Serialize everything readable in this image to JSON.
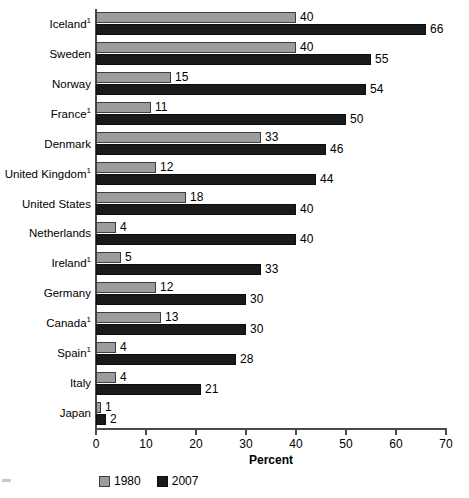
{
  "chart_data": {
    "type": "bar",
    "orientation": "horizontal",
    "title": "",
    "xlabel": "Percent",
    "ylabel": "",
    "xlim": [
      0,
      70
    ],
    "xticks": [
      0,
      10,
      20,
      30,
      40,
      50,
      60,
      70
    ],
    "grid": false,
    "legend_position": "bottom-left",
    "categories": [
      "Iceland¹",
      "Sweden",
      "Norway",
      "France¹",
      "Denmark",
      "United Kingdom¹",
      "United States",
      "Netherlands",
      "Ireland¹",
      "Germany",
      "Canada¹",
      "Spain¹",
      "Italy",
      "Japan"
    ],
    "category_labels": [
      {
        "name": "Iceland",
        "footnote": "1"
      },
      {
        "name": "Sweden",
        "footnote": ""
      },
      {
        "name": "Norway",
        "footnote": ""
      },
      {
        "name": "France",
        "footnote": "1"
      },
      {
        "name": "Denmark",
        "footnote": ""
      },
      {
        "name": "United Kingdom",
        "footnote": "1"
      },
      {
        "name": "United States",
        "footnote": ""
      },
      {
        "name": "Netherlands",
        "footnote": ""
      },
      {
        "name": "Ireland",
        "footnote": "1"
      },
      {
        "name": "Germany",
        "footnote": ""
      },
      {
        "name": "Canada",
        "footnote": "1"
      },
      {
        "name": "Spain",
        "footnote": "1"
      },
      {
        "name": "Italy",
        "footnote": ""
      },
      {
        "name": "Japan",
        "footnote": ""
      }
    ],
    "series": [
      {
        "name": "1980",
        "color": "#9c9c9c",
        "values": [
          40,
          40,
          15,
          11,
          33,
          12,
          18,
          4,
          5,
          12,
          13,
          4,
          4,
          1
        ]
      },
      {
        "name": "2007",
        "color": "#1a1a1a",
        "values": [
          66,
          55,
          54,
          50,
          46,
          44,
          40,
          40,
          33,
          30,
          30,
          28,
          21,
          2
        ]
      }
    ]
  },
  "legend": {
    "items": [
      {
        "label": "1980",
        "swatch": "legend-swatch-1980"
      },
      {
        "label": "2007",
        "swatch": "legend-swatch-2007"
      }
    ]
  },
  "axis": {
    "x_title": "Percent",
    "x_tick_labels": [
      "0",
      "10",
      "20",
      "30",
      "40",
      "50",
      "60",
      "70"
    ]
  }
}
